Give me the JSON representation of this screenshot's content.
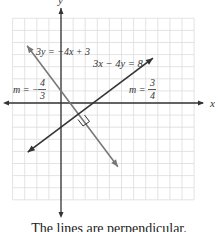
{
  "axes": {
    "x_label": "x",
    "y_label": "y",
    "x_range": [
      -4,
      11
    ],
    "y_range": [
      -8,
      7
    ],
    "grid": true
  },
  "lines": [
    {
      "id": "line-a",
      "equation": "3y = −4x + 3",
      "slope_label": "m = −",
      "slope_numerator": "4",
      "slope_denominator": "3",
      "slope": -1.3333,
      "intercept": 1,
      "color": "#777777",
      "x_from": -2.8,
      "x_to": 4.7
    },
    {
      "id": "line-b",
      "equation": "3x − 4y = 8",
      "slope_label": "m =",
      "slope_numerator": "3",
      "slope_denominator": "4",
      "slope": 0.75,
      "intercept": -2,
      "color": "#333333",
      "x_from": -2.75,
      "x_to": 7.6
    }
  ],
  "annotation": {
    "right_angle_marker": true
  },
  "caption": "The lines are perpendicular."
}
